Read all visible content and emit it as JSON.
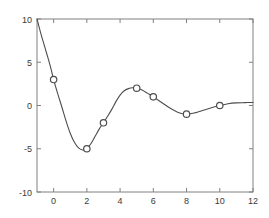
{
  "chart_data": {
    "type": "line",
    "title": "",
    "subtitle": "",
    "xlabel": "",
    "ylabel": "",
    "xlim": [
      -1,
      12
    ],
    "ylim": [
      -10,
      10
    ],
    "xticks": [
      0,
      2,
      4,
      6,
      8,
      10,
      12
    ],
    "xtick_labels": [
      "0",
      "2",
      "4",
      "6",
      "8",
      "10",
      "12"
    ],
    "yticks": [
      -10,
      -5,
      0,
      5,
      10
    ],
    "ytick_labels": [
      "-10",
      "-5",
      "0",
      "5",
      "10"
    ],
    "grid": false,
    "legend": "none",
    "series": [
      {
        "name": "interpolated-curve",
        "kind": "line",
        "color": "#4d4d4d",
        "x": [
          -1.0,
          -0.8,
          -0.6,
          -0.4,
          -0.2,
          0.0,
          0.25,
          0.5,
          0.75,
          1.0,
          1.25,
          1.5,
          1.75,
          2.0,
          2.25,
          2.5,
          2.75,
          3.0,
          3.25,
          3.5,
          3.75,
          4.0,
          4.25,
          4.5,
          4.75,
          5.0,
          5.25,
          5.5,
          5.75,
          6.0,
          6.5,
          7.0,
          7.5,
          8.0,
          8.5,
          9.0,
          9.5,
          10.0,
          10.5,
          11.0,
          11.5,
          12.0
        ],
        "y": [
          10.0,
          8.55,
          7.2,
          5.9,
          4.55,
          3.0,
          1.35,
          -0.2,
          -1.8,
          -3.2,
          -4.25,
          -4.9,
          -5.15,
          -5.0,
          -4.4,
          -3.55,
          -2.7,
          -2.0,
          -1.25,
          -0.45,
          0.45,
          1.2,
          1.7,
          1.95,
          2.05,
          2.0,
          1.85,
          1.6,
          1.3,
          1.0,
          0.35,
          -0.3,
          -0.8,
          -1.0,
          -0.85,
          -0.55,
          -0.25,
          0.0,
          0.2,
          0.3,
          0.33,
          0.35
        ]
      },
      {
        "name": "data-points",
        "kind": "scatter",
        "marker": "circle-open",
        "color": "#4d4d4d",
        "x": [
          0,
          2,
          3,
          5,
          6,
          8,
          10
        ],
        "y": [
          3,
          -5,
          -2,
          2,
          1,
          -1,
          0
        ]
      }
    ]
  },
  "axes": {
    "box_color": "#808080",
    "tick_color": "#808080",
    "label_color": "#3a3a3a",
    "background": "#ffffff"
  }
}
